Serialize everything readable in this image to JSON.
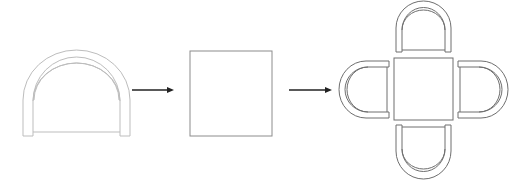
{
  "diagram": {
    "title": "",
    "colors": {
      "line_light": "#bdbdbd",
      "line_mid": "#8c8c8c",
      "arrow": "#222222",
      "background": "#ffffff"
    },
    "steps": [
      {
        "id": "chair",
        "label": "",
        "kind": "chair-plan"
      },
      {
        "id": "table",
        "label": "",
        "kind": "square-table-plan"
      },
      {
        "id": "table-with-chairs",
        "label": "",
        "kind": "table-with-four-chairs"
      }
    ],
    "arrows": [
      {
        "from": "chair",
        "to": "table"
      },
      {
        "from": "table",
        "to": "table-with-chairs"
      }
    ]
  }
}
